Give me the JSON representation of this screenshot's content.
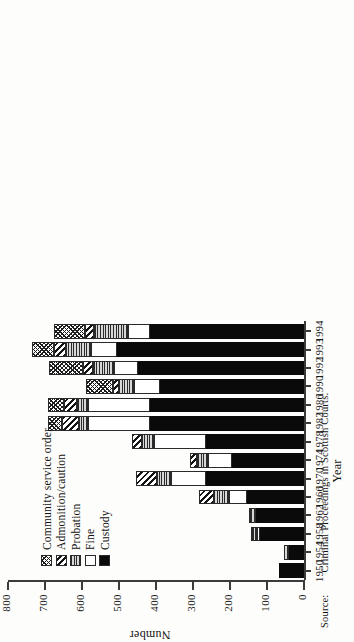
{
  "axis": {
    "value_title": "Number",
    "category_title": "Year",
    "value_ticks": [
      "800",
      "700",
      "600",
      "500",
      "400",
      "300",
      "200",
      "100",
      "0"
    ],
    "categories": [
      "1950",
      "1954",
      "1958",
      "1962",
      "1966",
      "1970",
      "1974",
      "1978",
      "1982",
      "1986",
      "1990",
      "1992",
      "1993",
      "1994"
    ]
  },
  "legend": {
    "items": [
      {
        "label": "Community service order",
        "pattern": "crosshatch"
      },
      {
        "label": "Admonition/caution",
        "pattern": "diagonal-stripes"
      },
      {
        "label": "Probation",
        "pattern": "horizontal-lines-grey"
      },
      {
        "label": "Fine",
        "pattern": "white"
      },
      {
        "label": "Custody",
        "pattern": "solid-black"
      }
    ]
  },
  "source": {
    "label": "Source:",
    "text": "Criminal Proceedings in Scottish Courts."
  },
  "chart_data": {
    "type": "bar",
    "subtype": "stacked-horizontal",
    "title": "",
    "xlabel": "Year",
    "ylabel": "Number",
    "ylim": [
      0,
      800
    ],
    "grid": false,
    "legend_position": "inside-left",
    "categories": [
      "1950",
      "1954",
      "1958",
      "1962",
      "1966",
      "1970",
      "1974",
      "1978",
      "1982",
      "1986",
      "1990",
      "1992",
      "1993",
      "1994"
    ],
    "series": [
      {
        "name": "Custody",
        "values": [
          68,
          40,
          120,
          130,
          155,
          265,
          195,
          265,
          415,
          415,
          390,
          450,
          505,
          415
        ]
      },
      {
        "name": "Fine",
        "values": [
          0,
          0,
          8,
          0,
          48,
          95,
          64,
          140,
          170,
          170,
          70,
          64,
          72,
          62
        ]
      },
      {
        "name": "Probation",
        "values": [
          0,
          15,
          10,
          14,
          40,
          38,
          29,
          32,
          23,
          29,
          40,
          55,
          67,
          90
        ]
      },
      {
        "name": "Admonition/caution",
        "values": [
          0,
          0,
          5,
          5,
          40,
          55,
          20,
          29,
          46,
          35,
          17,
          29,
          32,
          26
        ]
      },
      {
        "name": "Community service order",
        "values": [
          0,
          0,
          0,
          0,
          0,
          0,
          0,
          0,
          38,
          43,
          72,
          90,
          58,
          84
        ]
      }
    ],
    "totals": [
      68,
      55,
      143,
      149,
      283,
      453,
      308,
      466,
      692,
      692,
      589,
      688,
      734,
      677
    ]
  }
}
